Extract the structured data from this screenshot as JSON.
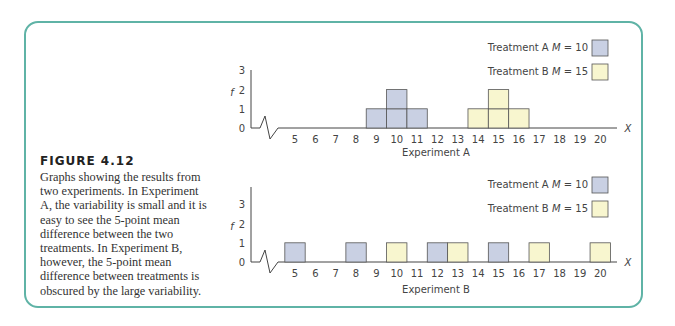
{
  "caption": {
    "title": "FIGURE 4.12",
    "text": "Graphs showing the results from two experiments. In Experiment A, the variability is small and it is easy to see the 5-point mean difference between the two treatments. In Experiment B, however, the 5-point mean difference between treatments is obscured by the large variability."
  },
  "colors": {
    "frame": "#5fb3a6",
    "treatment_a": "#c9d0e3",
    "treatment_b": "#f8f6cf",
    "bar_stroke": "#555555"
  },
  "chart_data": [
    {
      "type": "bar",
      "title": "Experiment A",
      "xlabel": "X",
      "ylabel": "f",
      "x_ticks": [
        5,
        6,
        7,
        8,
        9,
        10,
        11,
        12,
        13,
        14,
        15,
        16,
        17,
        18,
        19,
        20
      ],
      "y_ticks": [
        0,
        1,
        2,
        3
      ],
      "ylim": [
        0,
        3
      ],
      "legend": [
        {
          "label": "Treatment A",
          "mean_label": "M = 10"
        },
        {
          "label": "Treatment B",
          "mean_label": "M = 15"
        }
      ],
      "series": [
        {
          "name": "Treatment A",
          "mean": 10,
          "x": [
            9,
            10,
            11
          ],
          "values": [
            1,
            2,
            1
          ]
        },
        {
          "name": "Treatment B",
          "mean": 15,
          "x": [
            14,
            15,
            16
          ],
          "values": [
            1,
            2,
            1
          ]
        }
      ]
    },
    {
      "type": "bar",
      "title": "Experiment B",
      "xlabel": "X",
      "ylabel": "f",
      "x_ticks": [
        5,
        6,
        7,
        8,
        9,
        10,
        11,
        12,
        13,
        14,
        15,
        16,
        17,
        18,
        19,
        20
      ],
      "y_ticks": [
        0,
        1,
        2,
        3
      ],
      "ylim": [
        0,
        3
      ],
      "legend": [
        {
          "label": "Treatment A",
          "mean_label": "M = 10"
        },
        {
          "label": "Treatment B",
          "mean_label": "M = 15"
        }
      ],
      "series": [
        {
          "name": "Treatment A",
          "mean": 10,
          "x": [
            5,
            8,
            12,
            15
          ],
          "values": [
            1,
            1,
            1,
            1
          ]
        },
        {
          "name": "Treatment B",
          "mean": 15,
          "x": [
            10,
            13,
            17,
            20
          ],
          "values": [
            1,
            1,
            1,
            1
          ]
        }
      ]
    }
  ]
}
